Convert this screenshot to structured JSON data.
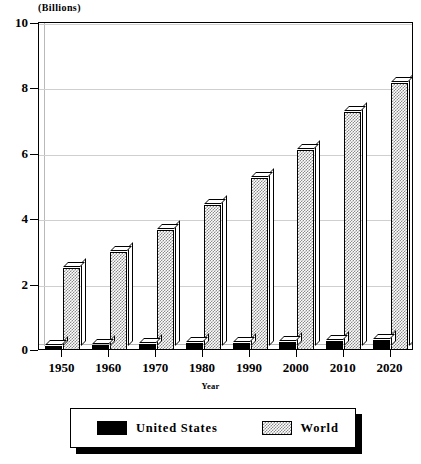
{
  "chart_data": {
    "type": "bar",
    "title": "",
    "unit_label": "(Billions)",
    "xlabel": "Year",
    "ylabel": "",
    "categories": [
      "1950",
      "1960",
      "1970",
      "1980",
      "1990",
      "2000",
      "2010",
      "2020"
    ],
    "series": [
      {
        "name": "United States",
        "values": [
          0.15,
          0.18,
          0.2,
          0.23,
          0.25,
          0.28,
          0.31,
          0.33
        ],
        "color": "#000000"
      },
      {
        "name": "World",
        "values": [
          2.55,
          3.03,
          3.7,
          4.45,
          5.3,
          6.15,
          7.3,
          8.2
        ],
        "color": "#8a8a8a"
      }
    ],
    "ylim": [
      0,
      10
    ],
    "yticks": [
      "0",
      "2",
      "4",
      "6",
      "8",
      "10"
    ],
    "grid": true,
    "legend_position": "bottom"
  },
  "legend": {
    "items": [
      {
        "label": "United States",
        "swatch": "solid-black"
      },
      {
        "label": "World",
        "swatch": "hatched-gray"
      }
    ]
  }
}
